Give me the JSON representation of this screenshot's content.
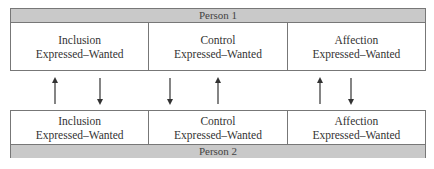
{
  "person1": {
    "label": "Person 1",
    "cells": [
      {
        "need": "Inclusion",
        "sub": "Expressed–Wanted"
      },
      {
        "need": "Control",
        "sub": "Expressed–Wanted"
      },
      {
        "need": "Affection",
        "sub": "Expressed–Wanted"
      }
    ]
  },
  "person2": {
    "label": "Person 2",
    "cells": [
      {
        "need": "Inclusion",
        "sub": "Expressed–Wanted"
      },
      {
        "need": "Control",
        "sub": "Expressed–Wanted"
      },
      {
        "need": "Affection",
        "sub": "Expressed–Wanted"
      }
    ]
  },
  "arrows": [
    {
      "x": 45,
      "dir": "up"
    },
    {
      "x": 90,
      "dir": "down"
    },
    {
      "x": 160,
      "dir": "down"
    },
    {
      "x": 208,
      "dir": "up"
    },
    {
      "x": 310,
      "dir": "up"
    },
    {
      "x": 341,
      "dir": "down"
    }
  ],
  "colors": {
    "band": "#c9c9c9",
    "border": "#777777",
    "arrow": "#333333"
  }
}
